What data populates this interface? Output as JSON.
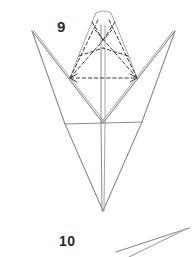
{
  "page": {
    "kind": "origami-instruction-diagram",
    "width": 194,
    "height": 257,
    "background_color": "#ffffff"
  },
  "colors": {
    "solid_line": "#8c8c8c",
    "solid_line_light": "#a6a6a6",
    "dashed_line": "#3c3c3c",
    "label_text": "#2b2b2b"
  },
  "labels": {
    "step_9": "9",
    "step_10": "10"
  },
  "figures": [
    {
      "name": "step-9-figure",
      "description": "four-pointed origami base with dashed cone overlay",
      "step": "9"
    },
    {
      "name": "step-10-figure",
      "description": "partial narrow wedge entering from bottom right",
      "step": "10"
    }
  ],
  "step9_geometry": {
    "left_tip": [
      32,
      31
    ],
    "right_tip": [
      175,
      31
    ],
    "bottom_tip": [
      103,
      211
    ],
    "center": [
      103,
      123
    ],
    "horizontal_left": [
      65,
      124
    ],
    "horizontal_right": [
      142,
      122
    ],
    "cone_apex_left": [
      96,
      12
    ],
    "cone_apex_right": [
      111,
      12
    ],
    "cone_base_left": [
      70,
      78
    ],
    "cone_base_right": [
      137,
      78
    ]
  },
  "step10_geometry": {
    "tip": [
      186,
      229
    ],
    "lower_left_a": [
      116,
      252
    ],
    "lower_left_b": [
      128,
      257
    ]
  }
}
